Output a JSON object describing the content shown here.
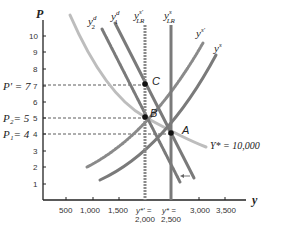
{
  "diagram": {
    "axes": {
      "y_label": "P",
      "x_label": "y",
      "y_ticks": [
        "1",
        "2",
        "3",
        "4",
        "5",
        "6",
        "7",
        "8",
        "9",
        "10"
      ],
      "x_ticks": [
        "500",
        "1,000",
        "1,500",
        "3,000",
        "3,500"
      ],
      "x_special": [
        {
          "line1": "y*' =",
          "line2": "2,000"
        },
        {
          "line1": "y* =",
          "line2": "2,500"
        }
      ]
    },
    "price_levels": [
      {
        "label": "P' = ",
        "value": "7"
      },
      {
        "label": "P₂= ",
        "value": "5"
      },
      {
        "label": "P₁= ",
        "value": "4"
      }
    ],
    "curves": {
      "y2d": {
        "base": "y",
        "sup": "d",
        "sub": "2"
      },
      "y1d": {
        "base": "y",
        "sup": "d",
        "sub": "1"
      },
      "lras_prime": {
        "base": "y",
        "sup": "s'",
        "sub": "LR"
      },
      "lras": {
        "base": "y",
        "sup": "s",
        "sub": "LR"
      },
      "ys_prime": {
        "base": "y",
        "sup": "s'"
      },
      "ys": {
        "base": "y",
        "sup": "s"
      },
      "money_curve_label": "Y* = 10,000"
    },
    "points": {
      "A": "A",
      "B": "B",
      "C": "C"
    },
    "colors": {
      "dark_curve": "#7a7a7a",
      "light_curve": "#bdbdbd",
      "axis": "#222222",
      "point": "#111111"
    }
  }
}
